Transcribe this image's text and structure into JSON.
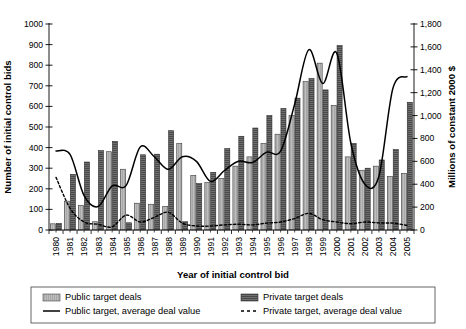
{
  "chart_data": {
    "type": "bar",
    "title": "",
    "xlabel": "Year of initial control bid",
    "ylabel": "Number of initial control bids",
    "ylabel_right": "Millions of constant 2000 $",
    "ylim": [
      0,
      1000
    ],
    "ylim_right": [
      0,
      1800
    ],
    "ytick_step": 100,
    "ytick_step_right": 200,
    "grid": false,
    "legend_position": "bottom",
    "categories": [
      "1980",
      "1981",
      "1982",
      "1983",
      "1984",
      "1985",
      "1986",
      "1987",
      "1988",
      "1989",
      "1990",
      "1991",
      "1992",
      "1993",
      "1994",
      "1995",
      "1996",
      "1997",
      "1998",
      "1999",
      "2000",
      "2001",
      "2002",
      "2003",
      "2004",
      "2005"
    ],
    "yticks": [
      "0",
      "100",
      "200",
      "300",
      "400",
      "500",
      "600",
      "700",
      "800",
      "900",
      "1000"
    ],
    "yticks_right": [
      "0",
      "200",
      "400",
      "600",
      "800",
      "1,000",
      "1,200",
      "1,400",
      "1,600",
      "1,800"
    ],
    "series": [
      {
        "name": "Public target deals",
        "type": "bar",
        "axis": "left",
        "fill": "#b5b5b5",
        "values": [
          30,
          140,
          120,
          40,
          380,
          295,
          130,
          125,
          115,
          420,
          265,
          230,
          250,
          310,
          355,
          420,
          465,
          555,
          720,
          810,
          605,
          355,
          290,
          310,
          260,
          275
        ]
      },
      {
        "name": "Private target deals",
        "type": "bar",
        "axis": "left",
        "fill": "#6d6d6d",
        "values": [
          32,
          270,
          330,
          385,
          430,
          35,
          365,
          368,
          482,
          40,
          225,
          280,
          395,
          455,
          495,
          555,
          590,
          640,
          735,
          680,
          895,
          420,
          300,
          340,
          390,
          620
        ]
      },
      {
        "name": "Public target, average deal value",
        "type": "line",
        "style": "solid",
        "axis": "right",
        "values": [
          690,
          660,
          300,
          205,
          385,
          390,
          725,
          640,
          530,
          640,
          600,
          425,
          520,
          600,
          590,
          680,
          690,
          1100,
          1575,
          1280,
          1545,
          760,
          400,
          470,
          1240,
          1340
        ]
      },
      {
        "name": "Private target, average deal value",
        "type": "line",
        "style": "dashed",
        "axis": "right",
        "values": [
          460,
          190,
          70,
          50,
          28,
          130,
          70,
          110,
          155,
          60,
          35,
          35,
          45,
          50,
          45,
          60,
          70,
          100,
          145,
          90,
          70,
          55,
          70,
          62,
          60,
          40
        ]
      }
    ]
  },
  "legend": {
    "items": [
      {
        "label": "Public target deals",
        "marker": "swatch-light"
      },
      {
        "label": "Private target deals",
        "marker": "swatch-dark"
      },
      {
        "label": "Public target, average deal value",
        "marker": "line-solid"
      },
      {
        "label": "Private target, average deal value",
        "marker": "line-dashed"
      }
    ]
  },
  "colors": {
    "public_bar": "#b5b5b5",
    "private_bar": "#6d6d6d",
    "axis": "#000000",
    "background": "#ffffff"
  }
}
